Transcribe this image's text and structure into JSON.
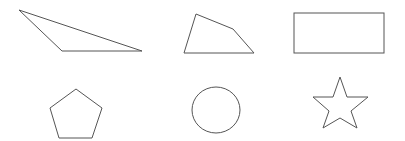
{
  "canvas": {
    "width": 405,
    "height": 141,
    "background": "#ffffff",
    "stroke": "#555555"
  },
  "shapes": [
    {
      "name": "triangle",
      "type": "polygon",
      "points": "19,10 62,51 142,51"
    },
    {
      "name": "quadrilateral",
      "type": "polygon",
      "points": "196,14 233,29 254,53 184,53"
    },
    {
      "name": "rectangle",
      "type": "rect",
      "x": 294,
      "y": 13,
      "width": 90,
      "height": 40
    },
    {
      "name": "pentagon",
      "type": "polygon",
      "points": "76,89 102,108 92,138 59,138 50,108"
    },
    {
      "name": "circle",
      "type": "ellipse",
      "cx": 216,
      "cy": 110,
      "rx": 24,
      "ry": 23
    },
    {
      "name": "star",
      "type": "polygon",
      "points": "340,77 347,97 368,97 351,111 357,128 340,118 323,128 329,111 313,97 333,97"
    }
  ]
}
